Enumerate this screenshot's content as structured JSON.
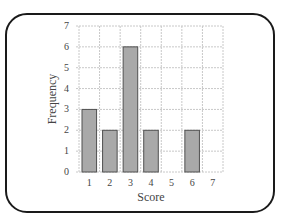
{
  "chart_data": {
    "type": "bar",
    "title": "",
    "xlabel": "Score",
    "ylabel": "Frequency",
    "categories": [
      "1",
      "2",
      "3",
      "4",
      "5",
      "6",
      "7"
    ],
    "values": [
      3,
      2,
      6,
      2,
      0,
      2,
      0
    ],
    "ylim": [
      0,
      7
    ],
    "yticks": [
      "0",
      "1",
      "2",
      "3",
      "4",
      "5",
      "6",
      "7"
    ],
    "grid": true,
    "legend": null
  },
  "colors": {
    "bar_fill": "#a9a9a9",
    "bar_edge": "#505050",
    "grid": "#c8c8c8",
    "frame": "#1a1a1a"
  }
}
